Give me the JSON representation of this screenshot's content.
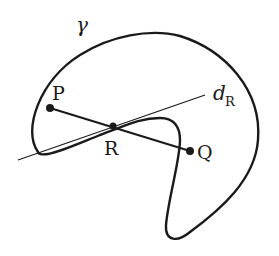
{
  "diagram": {
    "curve": {
      "label": "γ",
      "name": "closed curve gamma"
    },
    "line": {
      "label": "d",
      "subscript": "R",
      "name": "line d_R through R"
    },
    "points": [
      {
        "id": "P",
        "label": "P"
      },
      {
        "id": "R",
        "label": "R"
      },
      {
        "id": "Q",
        "label": "Q"
      }
    ],
    "segment": {
      "from": "P",
      "to": "Q",
      "through": "R"
    },
    "colors": {
      "stroke": "#1a1a1a",
      "background": "#ffffff"
    }
  }
}
